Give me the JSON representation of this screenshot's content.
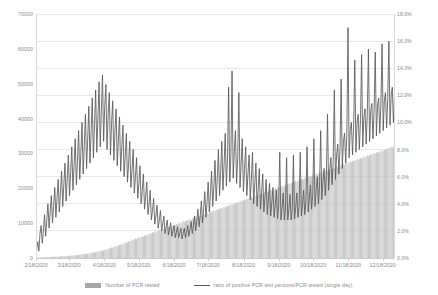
{
  "chart_data": {
    "type": "bar",
    "title": "",
    "subtitle": "",
    "xlabel": "",
    "ylabel": "",
    "y2label": "",
    "grid": true,
    "legend_position": "bottom",
    "axis_left": {
      "ticks": [
        "0",
        "10000",
        "20000",
        "30000",
        "40000",
        "50000",
        "60000",
        "70000"
      ],
      "min": 0,
      "max": 70000
    },
    "axis_right": {
      "ticks": [
        "0.0%",
        "2.0%",
        "4.0%",
        "6.0%",
        "8.0%",
        "10.0%",
        "12.0%",
        "14.0%",
        "16.0%",
        "18.0%"
      ],
      "min": 0,
      "max": 18
    },
    "x_tick_labels": [
      "2/18/2020",
      "3/18/2020",
      "4/18/2020",
      "5/18/2020",
      "6/18/2020",
      "7/18/2020",
      "8/18/2020",
      "9/18/2020",
      "10/18/2020",
      "11/18/2020",
      "12/18/2020"
    ],
    "x_tick_positions": [
      0,
      29,
      60,
      90,
      121,
      151,
      182,
      213,
      243,
      274,
      304
    ],
    "x_count": 315,
    "series": [
      {
        "name": "Number of PCR tested",
        "type": "bar",
        "axis": "left",
        "color": "#bfbfbf",
        "values": [
          120,
          140,
          110,
          180,
          220,
          160,
          140,
          200,
          260,
          240,
          300,
          280,
          320,
          360,
          300,
          340,
          420,
          380,
          360,
          440,
          480,
          420,
          460,
          520,
          500,
          560,
          600,
          540,
          580,
          660,
          700,
          640,
          720,
          780,
          740,
          820,
          900,
          860,
          940,
          1020,
          980,
          1100,
          1180,
          1120,
          1240,
          1320,
          1280,
          1400,
          1500,
          1460,
          1580,
          1700,
          1640,
          1780,
          1900,
          1840,
          2000,
          2150,
          2050,
          2250,
          2400,
          2300,
          2500,
          2700,
          2600,
          2850,
          3050,
          2900,
          3150,
          3400,
          3250,
          3500,
          3750,
          3600,
          3850,
          4100,
          3900,
          4200,
          4500,
          4300,
          4600,
          4900,
          4700,
          5000,
          5300,
          5050,
          5350,
          5650,
          5400,
          5700,
          6000,
          5750,
          6050,
          6350,
          6100,
          6400,
          6700,
          6450,
          6750,
          7050,
          6800,
          7100,
          7400,
          7150,
          7450,
          7750,
          7500,
          7800,
          8100,
          7850,
          8150,
          8450,
          8200,
          8500,
          8800,
          8550,
          8850,
          9150,
          8900,
          9200,
          9500,
          9250,
          9550,
          9850,
          9600,
          9900,
          10200,
          9950,
          10250,
          10550,
          10300,
          10600,
          10900,
          10650,
          10950,
          11250,
          11000,
          11300,
          11600,
          11350,
          11650,
          11950,
          11700,
          12000,
          12300,
          12050,
          12350,
          12650,
          12400,
          12700,
          13000,
          12750,
          13050,
          13350,
          13100,
          13400,
          13700,
          13450,
          13750,
          14050,
          13800,
          14100,
          14400,
          14150,
          14450,
          14750,
          14500,
          14800,
          15100,
          14850,
          15150,
          15450,
          15200,
          15500,
          15800,
          15550,
          15850,
          16150,
          15900,
          16200,
          16500,
          16250,
          16550,
          16850,
          16600,
          16900,
          17200,
          16950,
          17250,
          17550,
          17300,
          17600,
          17900,
          17650,
          17950,
          18250,
          18000,
          18300,
          18600,
          18350,
          18650,
          18950,
          18700,
          19000,
          19300,
          19050,
          19350,
          19650,
          19400,
          19700,
          20000,
          19750,
          20050,
          20350,
          20100,
          20400,
          20700,
          20450,
          20750,
          21050,
          20800,
          21100,
          21400,
          21150,
          21450,
          21750,
          21500,
          21800,
          22100,
          21850,
          22150,
          22450,
          22200,
          22500,
          22800,
          22550,
          22850,
          23150,
          22900,
          23200,
          23500,
          23250,
          23550,
          23850,
          23600,
          23900,
          24200,
          23950,
          24250,
          24550,
          24300,
          24600,
          24900,
          24650,
          24950,
          25250,
          25000,
          25300,
          25600,
          25350,
          25650,
          25950,
          25700,
          26000,
          26300,
          26050,
          26350,
          26650,
          26400,
          26700,
          27000,
          26750,
          27050,
          27350,
          27100,
          27400,
          27700,
          27450,
          27750,
          28050,
          27800,
          28100,
          28400,
          28150,
          28450,
          28750,
          28500,
          28800,
          29100,
          28850,
          29150,
          29450,
          29200,
          29500,
          29800,
          29550,
          29850,
          30150,
          29900,
          30200,
          30500,
          30250,
          30550,
          30850,
          30600,
          30900,
          31200,
          30950,
          31250,
          31550,
          31300,
          31600,
          31900,
          31650,
          31950,
          32250,
          32000,
          32300,
          32600,
          32350,
          32650
        ]
      },
      {
        "name": "ratio of positive PCR test persons/PCR tested (single day)",
        "type": "line",
        "axis": "right",
        "color": "#595959",
        "values": [
          0.6,
          1.2,
          0.5,
          1.8,
          2.4,
          1.1,
          2.0,
          3.2,
          1.6,
          2.8,
          4.0,
          2.2,
          3.4,
          4.6,
          2.6,
          3.8,
          5.2,
          3.0,
          4.4,
          5.8,
          3.4,
          4.8,
          6.4,
          3.8,
          5.4,
          7.0,
          4.2,
          5.9,
          7.6,
          4.6,
          6.3,
          8.2,
          5.0,
          6.8,
          8.8,
          5.4,
          7.2,
          9.4,
          5.8,
          7.8,
          10.0,
          6.2,
          8.3,
          10.6,
          6.6,
          8.8,
          11.2,
          7.0,
          9.3,
          11.8,
          7.4,
          9.9,
          12.4,
          7.8,
          10.4,
          13.0,
          8.2,
          10.9,
          13.5,
          8.6,
          11.2,
          12.8,
          8.0,
          10.6,
          12.2,
          7.6,
          10.0,
          11.6,
          7.2,
          9.4,
          11.0,
          6.8,
          8.8,
          10.4,
          6.4,
          8.2,
          9.8,
          6.0,
          7.6,
          9.2,
          5.6,
          7.0,
          8.6,
          5.2,
          6.5,
          8.0,
          4.8,
          6.0,
          7.4,
          4.4,
          5.5,
          6.8,
          4.0,
          5.0,
          6.2,
          3.6,
          4.5,
          5.6,
          3.2,
          4.0,
          5.0,
          2.8,
          3.5,
          4.4,
          2.5,
          3.1,
          3.9,
          2.2,
          2.8,
          3.5,
          2.0,
          2.5,
          3.1,
          1.8,
          2.3,
          2.8,
          1.7,
          2.1,
          2.6,
          1.6,
          2.0,
          2.4,
          1.5,
          1.9,
          2.3,
          1.5,
          1.8,
          2.2,
          1.4,
          1.8,
          2.2,
          1.5,
          1.9,
          2.4,
          1.6,
          2.1,
          2.7,
          1.8,
          2.4,
          3.1,
          2.0,
          2.7,
          3.6,
          2.3,
          3.1,
          4.2,
          2.6,
          3.6,
          4.9,
          3.0,
          4.1,
          5.6,
          3.4,
          4.7,
          6.4,
          3.8,
          5.3,
          7.2,
          4.2,
          5.9,
          8.0,
          4.6,
          6.4,
          8.6,
          5.0,
          6.9,
          9.2,
          5.3,
          7.3,
          12.6,
          5.6,
          7.6,
          13.8,
          5.9,
          7.9,
          9.4,
          5.5,
          7.4,
          12.2,
          5.2,
          7.0,
          8.8,
          4.9,
          6.6,
          8.2,
          4.6,
          6.2,
          7.6,
          4.3,
          5.8,
          7.8,
          4.0,
          5.4,
          7.0,
          3.8,
          5.1,
          6.6,
          3.6,
          4.8,
          6.2,
          3.4,
          4.5,
          5.8,
          3.2,
          4.3,
          5.5,
          3.1,
          4.1,
          5.2,
          3.0,
          3.9,
          5.0,
          2.9,
          3.8,
          7.8,
          2.8,
          3.7,
          4.8,
          2.8,
          3.6,
          7.4,
          2.8,
          3.6,
          4.7,
          2.8,
          3.6,
          7.6,
          2.9,
          3.7,
          4.8,
          3.0,
          3.8,
          7.8,
          3.1,
          4.0,
          5.0,
          3.2,
          4.2,
          8.2,
          3.4,
          4.4,
          5.4,
          3.6,
          4.7,
          8.8,
          3.8,
          5.0,
          6.0,
          4.0,
          5.3,
          9.4,
          4.3,
          5.7,
          6.6,
          4.6,
          6.1,
          10.6,
          5.0,
          6.6,
          7.4,
          5.4,
          7.1,
          12.4,
          5.8,
          7.6,
          8.4,
          6.2,
          8.1,
          13.2,
          6.6,
          8.6,
          9.2,
          7.0,
          9.1,
          17.0,
          7.4,
          9.5,
          10.0,
          7.6,
          9.8,
          14.6,
          7.8,
          10.0,
          10.6,
          8.0,
          10.2,
          15.0,
          8.2,
          10.4,
          11.0,
          8.4,
          10.6,
          15.4,
          8.6,
          10.8,
          11.4,
          8.8,
          11.0,
          15.2,
          9.0,
          11.2,
          11.8,
          9.2,
          11.4,
          15.8,
          9.4,
          11.6,
          12.2,
          9.6,
          11.8,
          16.0,
          9.8,
          12.0,
          12.6,
          10.0,
          12.2,
          16.2,
          10.2,
          12.4,
          13.0,
          10.4,
          12.6,
          15.6,
          10.6,
          12.8,
          13.2,
          10.8,
          13.0
        ]
      }
    ]
  },
  "legend": [
    {
      "label": "Number of PCR tested",
      "marker": "bar",
      "color": "#a6a6a6"
    },
    {
      "label": "ratio of positive PCR test persons/PCR tested (single day)",
      "marker": "line",
      "color": "#595959"
    }
  ]
}
